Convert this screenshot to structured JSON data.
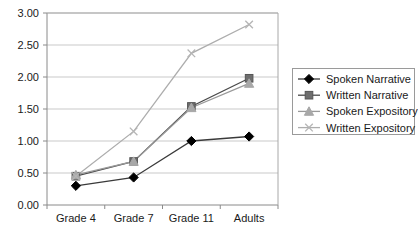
{
  "chart_data": {
    "type": "line",
    "title": "",
    "xlabel": "",
    "ylabel": "",
    "categories": [
      "Grade 4",
      "Grade 7",
      "Grade 11",
      "Adults"
    ],
    "ylim": [
      0,
      3
    ],
    "yticks": [
      "0.00",
      "0.50",
      "1.00",
      "1.50",
      "2.00",
      "2.50",
      "3.00"
    ],
    "ytick_values": [
      0,
      0.5,
      1.0,
      1.5,
      2.0,
      2.5,
      3.0
    ],
    "grid": "horizontal",
    "legend_position": "right",
    "series": [
      {
        "name": "Spoken Narrative",
        "marker": "diamond",
        "color": "#000000",
        "line_color": "#3a3a3a",
        "values": [
          0.3,
          0.43,
          1.0,
          1.07
        ]
      },
      {
        "name": "Written Narrative",
        "marker": "square",
        "color": "#6e6e6e",
        "line_color": "#4a4a4a",
        "values": [
          0.45,
          0.68,
          1.54,
          1.98
        ]
      },
      {
        "name": "Spoken Expository",
        "marker": "triangle",
        "color": "#a8a8a8",
        "line_color": "#9a9a9a",
        "values": [
          0.47,
          0.68,
          1.52,
          1.9
        ]
      },
      {
        "name": "Written Expository",
        "marker": "cross",
        "color": "#b5b5b5",
        "line_color": "#adadad",
        "values": [
          0.45,
          1.15,
          2.37,
          2.82
        ]
      }
    ]
  },
  "axes": {
    "axis_color": "#8a8a8a",
    "grid_color": "#c9c9c9",
    "background": "#ffffff"
  },
  "legend": {
    "border_color": "#9a9a9a",
    "background": "#ffffff",
    "items": [
      {
        "label": "Spoken Narrative"
      },
      {
        "label": "Written Narrative"
      },
      {
        "label": "Spoken Expository"
      },
      {
        "label": "Written Expository"
      }
    ]
  }
}
